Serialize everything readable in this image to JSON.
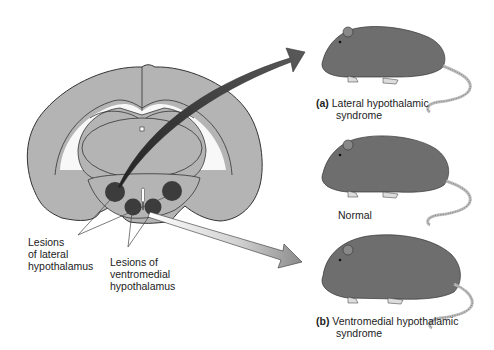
{
  "figure": {
    "brain_section": "coronal-brain-section",
    "lesion_labels": {
      "lateral": [
        "Lesions",
        "of lateral",
        "hypothalamus"
      ],
      "ventromedial": [
        "Lesions of",
        "ventromedial",
        "hypothalamus"
      ]
    },
    "rats": [
      {
        "id": "a",
        "letter": "(a)",
        "caption_line1": "Lateral hypothalamic",
        "caption_line2": "syndrome",
        "body": "thin"
      },
      {
        "id": "normal",
        "letter": "",
        "caption_line1": "Normal",
        "caption_line2": "",
        "body": "normal"
      },
      {
        "id": "b",
        "letter": "(b)",
        "caption_line1": "Ventromedial hypothalamic",
        "caption_line2": "syndrome",
        "body": "obese"
      }
    ],
    "colors": {
      "brain_fill": "#b4b4b4",
      "outline": "#333333",
      "lesion": "#3c3c3c",
      "rat_body": "#6e6e6e",
      "arrow_dark": "#555555",
      "arrow_light": "#9a9a9a",
      "tail": "#d8d8d8"
    }
  }
}
